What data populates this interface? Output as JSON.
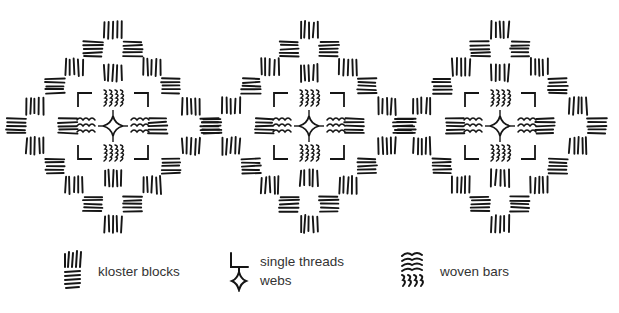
{
  "diagram": {
    "title": "",
    "ink_color": "#151515",
    "background": "#ffffff",
    "motif_centers": [
      {
        "cx": 113,
        "cy": 128
      },
      {
        "cx": 309,
        "cy": 128
      },
      {
        "cx": 500,
        "cy": 128
      }
    ],
    "motif": {
      "outer_kloster_blocks": [
        {
          "dx": 0,
          "dy": -98,
          "orient": "v"
        },
        {
          "dx": -20,
          "dy": -79,
          "orient": "h"
        },
        {
          "dx": 20,
          "dy": -79,
          "orient": "h"
        },
        {
          "dx": -39,
          "dy": -61,
          "orient": "v"
        },
        {
          "dx": 39,
          "dy": -61,
          "orient": "v"
        },
        {
          "dx": -58,
          "dy": -42,
          "orient": "h"
        },
        {
          "dx": 58,
          "dy": -42,
          "orient": "h"
        },
        {
          "dx": -78,
          "dy": -22,
          "orient": "v"
        },
        {
          "dx": 78,
          "dy": -22,
          "orient": "v"
        },
        {
          "dx": -97,
          "dy": -2,
          "orient": "h"
        },
        {
          "dx": 97,
          "dy": -2,
          "orient": "h"
        },
        {
          "dx": -78,
          "dy": 18,
          "orient": "v"
        },
        {
          "dx": 78,
          "dy": 18,
          "orient": "v"
        },
        {
          "dx": -58,
          "dy": 38,
          "orient": "h"
        },
        {
          "dx": 58,
          "dy": 38,
          "orient": "h"
        },
        {
          "dx": -39,
          "dy": 57,
          "orient": "v"
        },
        {
          "dx": 39,
          "dy": 57,
          "orient": "v"
        },
        {
          "dx": -20,
          "dy": 76,
          "orient": "h"
        },
        {
          "dx": 20,
          "dy": 76,
          "orient": "h"
        },
        {
          "dx": 0,
          "dy": 96,
          "orient": "v"
        }
      ],
      "inner_kloster_blocks": [
        {
          "dx": 0,
          "dy": -55,
          "orient": "v"
        },
        {
          "dx": 0,
          "dy": 50,
          "orient": "v"
        },
        {
          "dx": -45,
          "dy": -2,
          "orient": "h"
        },
        {
          "dx": 45,
          "dy": -2,
          "orient": "h"
        }
      ],
      "woven_bars": [
        {
          "dx": 0,
          "dy": -30,
          "orient": "v"
        },
        {
          "dx": 0,
          "dy": 25,
          "orient": "v"
        },
        {
          "dx": -27,
          "dy": -2,
          "orient": "h"
        },
        {
          "dx": 27,
          "dy": -2,
          "orient": "h"
        }
      ],
      "single_thread_brackets": [
        {
          "dx": -35,
          "dy": -35,
          "corner": "tl"
        },
        {
          "dx": 35,
          "dy": -35,
          "corner": "tr"
        },
        {
          "dx": -35,
          "dy": 31,
          "corner": "bl"
        },
        {
          "dx": 35,
          "dy": 31,
          "corner": "br"
        }
      ],
      "center_web": {
        "dx": 0,
        "dy": -2,
        "r": 10
      }
    }
  },
  "legend": {
    "items": [
      {
        "key": "kloster",
        "label": "kloster blocks",
        "x": 62,
        "y": 0
      },
      {
        "key": "threads",
        "label": "single threads",
        "label2": "webs",
        "x": 228,
        "y": 0
      },
      {
        "key": "woven",
        "label": "woven bars",
        "x": 398,
        "y": 0
      }
    ]
  }
}
